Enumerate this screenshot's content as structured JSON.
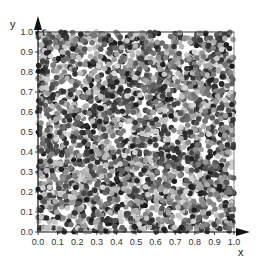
{
  "chart_data": {
    "type": "scatter",
    "title": "",
    "xlabel": "x",
    "ylabel": "y",
    "xlim": [
      0.0,
      1.0
    ],
    "ylim": [
      0.0,
      1.0
    ],
    "x_ticks": [
      "0.0",
      "0.1",
      "0.2",
      "0.3",
      "0.4",
      "0.5",
      "0.6",
      "0.7",
      "0.8",
      "0.9",
      "1.0"
    ],
    "y_ticks": [
      "0.0",
      "0.1",
      "0.2",
      "0.3",
      "0.4",
      "0.5",
      "0.6",
      "0.7",
      "0.8",
      "0.9",
      "1.0"
    ],
    "grid": false,
    "legend": null,
    "series": [
      {
        "name": "uniform random points",
        "distribution": "uniform over [0,1]x[0,1]",
        "approx_point_count": 3000,
        "marker": "circle",
        "marker_diameter_px": 5.5,
        "color_scale": "grayscale",
        "color_range": [
          "#1a1a1a",
          "#d8d8d8"
        ]
      }
    ]
  },
  "colors": {
    "axis": "#111111",
    "background": "#ffffff"
  }
}
